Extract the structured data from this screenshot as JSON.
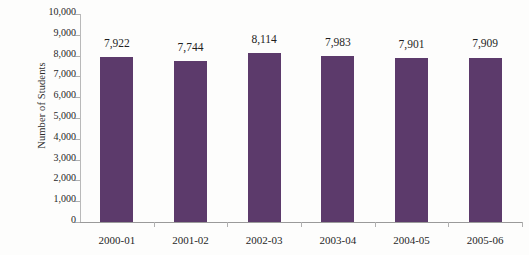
{
  "chart_data": {
    "type": "bar",
    "title": "",
    "xlabel": "",
    "ylabel": "Number of Students",
    "categories": [
      "2000-01",
      "2001-02",
      "2002-03",
      "2003-04",
      "2004-05",
      "2005-06"
    ],
    "values": [
      7922,
      7744,
      8114,
      7983,
      7901,
      7909
    ],
    "value_labels": [
      "7,922",
      "7,744",
      "8,114",
      "7,983",
      "7,901",
      "7,909"
    ],
    "ylim": [
      0,
      10000
    ],
    "ytick_values": [
      0,
      1000,
      2000,
      3000,
      4000,
      5000,
      6000,
      7000,
      8000,
      9000,
      10000
    ],
    "ytick_labels": [
      "0",
      "1,000",
      "2,000",
      "3,000",
      "4,000",
      "5,000",
      "6,000",
      "7,000",
      "8,000",
      "9,000",
      "10,000"
    ],
    "grid": false,
    "legend": null,
    "bar_color": "#5c3a6b",
    "axis_color": "#9a9a9a",
    "background_color": "#fdfdfc",
    "text_color": "#1f1f1f"
  }
}
